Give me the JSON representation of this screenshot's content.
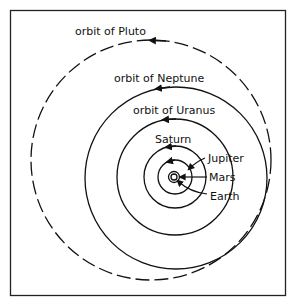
{
  "diagram": {
    "type": "solar-system-orbits",
    "labels": {
      "pluto": "orbit of Pluto",
      "neptune": "orbit of Neptune",
      "uranus": "orbit of Uranus",
      "saturn": "Saturn",
      "jupiter": "Jupiter",
      "mars": "Mars",
      "earth": "Earth"
    },
    "colors": {
      "line": "#111111",
      "background": "#ffffff"
    }
  }
}
